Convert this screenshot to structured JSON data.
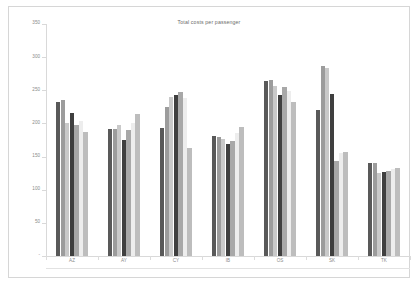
{
  "chart_data": {
    "type": "bar",
    "title": "Total costs per passenger",
    "xlabel": "",
    "ylabel": "",
    "ylim": [
      0,
      350
    ],
    "ytick_values": [
      0,
      50,
      100,
      150,
      200,
      250,
      300,
      350
    ],
    "ytick_labels": [
      "-",
      "50",
      "100",
      "150",
      "200",
      "250",
      "300",
      "350"
    ],
    "grid": false,
    "legend": "none",
    "categories": [
      "AZ",
      "AY",
      "CY",
      "IB",
      "OS",
      "SK",
      "TK"
    ],
    "series": [
      {
        "name": "Series 1",
        "color": "#595959",
        "values": [
          233,
          191,
          193,
          181,
          264,
          221,
          140
        ]
      },
      {
        "name": "Series 2",
        "color": "#9c9c9c",
        "values": [
          236,
          192,
          225,
          180,
          265,
          286,
          141
        ]
      },
      {
        "name": "Series 3",
        "color": "#c9c9c9",
        "values": [
          201,
          198,
          240,
          176,
          256,
          284,
          125
        ]
      },
      {
        "name": "Series 4",
        "color": "#3f3f3f",
        "values": [
          216,
          175,
          243,
          169,
          243,
          244,
          127
        ]
      },
      {
        "name": "Series 5",
        "color": "#a8a8a8",
        "values": [
          198,
          190,
          248,
          173,
          255,
          143,
          128
        ]
      },
      {
        "name": "Series 6",
        "color": "#ededed",
        "values": [
          204,
          201,
          238,
          185,
          249,
          156,
          131
        ]
      },
      {
        "name": "Series 7",
        "color": "#bdbdbd",
        "values": [
          187,
          215,
          163,
          194,
          232,
          157,
          133
        ]
      }
    ]
  },
  "axis": {
    "y_max_label": "350",
    "y_zero_label": "-"
  }
}
